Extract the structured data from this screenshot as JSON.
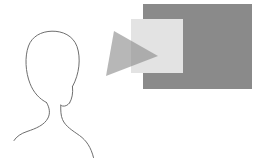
{
  "figure": {
    "title": "Viewer facing display",
    "type": "illustration",
    "canvas": {
      "width": 257,
      "height": 158,
      "background_color": "#ffffff"
    },
    "shapes": [
      {
        "id": "back-panel",
        "name": "dark-rectangle",
        "role": "background display panel",
        "shape": "rectangle",
        "x": 143,
        "y": 4,
        "width": 109,
        "height": 85,
        "fill_color": "#8a8a8a",
        "stroke_color": "none",
        "opacity": 1
      },
      {
        "id": "front-panel",
        "name": "light-square",
        "role": "foreground screen overlay",
        "shape": "rectangle",
        "x": 131,
        "y": 19,
        "width": 52,
        "height": 54,
        "fill_color": "#e3e3e3",
        "stroke_color": "none",
        "opacity": 1
      },
      {
        "id": "view-cone",
        "name": "gray-triangle",
        "role": "gaze cone pointing right",
        "shape": "triangle",
        "points": "114,31 158,56 106,76",
        "fill_color": "#8a8a8a",
        "stroke_color": "none",
        "opacity": 0.62
      },
      {
        "id": "person-outline",
        "name": "head-and-shoulders-outline",
        "role": "viewer silhouette outline",
        "shape": "path",
        "fill_color": "none",
        "stroke_color": "#6e6e6e",
        "stroke_width": 1
      }
    ],
    "colors": {
      "panel_dark": "#8a8a8a",
      "panel_light": "#e3e3e3",
      "cone_gray": "#8a8a8a",
      "outline_gray": "#6e6e6e",
      "background": "#ffffff"
    }
  }
}
